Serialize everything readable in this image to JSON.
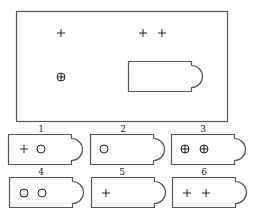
{
  "diagram": {
    "type": "puzzle-card-matching",
    "main_panel": {
      "symbols": [
        {
          "kind": "plus",
          "x": 61,
          "y": 33
        },
        {
          "kind": "plus",
          "x": 143,
          "y": 33
        },
        {
          "kind": "plus",
          "x": 162,
          "y": 33
        },
        {
          "kind": "circled-plus",
          "x": 61,
          "y": 77
        }
      ],
      "card_slot": {
        "x": 128,
        "y": 61,
        "w": 63,
        "h": 30
      }
    },
    "options": [
      {
        "label": "1",
        "symbols": [
          "plus",
          "circle"
        ]
      },
      {
        "label": "2",
        "symbols": [
          "circle"
        ]
      },
      {
        "label": "3",
        "symbols": [
          "circled-plus",
          "circled-plus"
        ]
      },
      {
        "label": "4",
        "symbols": [
          "circle",
          "circle"
        ]
      },
      {
        "label": "5",
        "symbols": [
          "plus"
        ]
      },
      {
        "label": "6",
        "symbols": [
          "plus",
          "plus"
        ]
      }
    ],
    "colors": {
      "stroke": "#555555",
      "symbol": "#222222",
      "background": "#ffffff"
    }
  }
}
